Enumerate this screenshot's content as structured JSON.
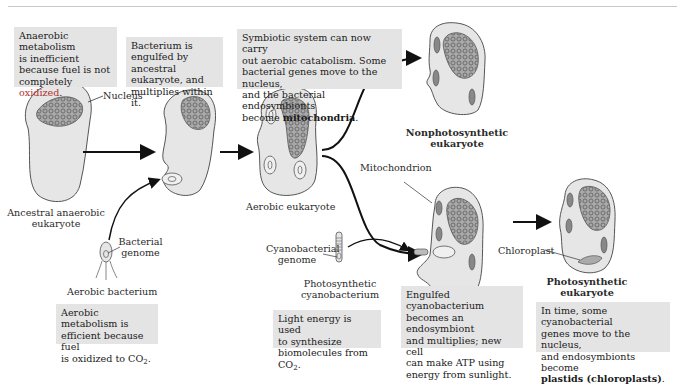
{
  "captions": {
    "anaerobic_inefficient": {
      "lines": [
        "Anaerobic",
        "metabolism",
        "is inefficient",
        "because fuel is not",
        "completely "
      ],
      "highlight": "oxidized",
      "end": "."
    },
    "engulfed_bacterium": [
      "Bacterium is",
      "engulfed by ancestral",
      "eukaryote, and",
      "multiplies within it."
    ],
    "symbiotic_system": {
      "lines": [
        "Symbiotic system can now carry",
        "out aerobic catabolism. Some",
        "bacterial genes move to the nucleus,",
        "and the bacterial endosymbionts",
        "become "
      ],
      "bold": "mitochondria",
      "end": "."
    },
    "aerobic_efficient": {
      "lines": [
        "Aerobic metabolism is",
        "efficient because fuel",
        "is oxidized to CO"
      ],
      "sub": "2",
      "end": "."
    },
    "light_energy": {
      "lines": [
        "Light energy is used",
        "to synthesize",
        "biomolecules from CO"
      ],
      "sub": "2",
      "end": "."
    },
    "engulfed_cyanobacterium": [
      "Engulfed cyanobacterium",
      "becomes an endosymbiont",
      "and multiplies; new cell",
      "can make ATP using",
      "energy from sunlight."
    ],
    "plastids": {
      "lines": [
        "In time, some cyanobacterial",
        "genes move to the nucleus,",
        "and endosymbionts become"
      ],
      "bold": "plastids (chloroplasts)",
      "end": "."
    }
  },
  "labels": {
    "nucleus": "Nucleus",
    "ancestral": [
      "Ancestral anaerobic",
      "eukaryote"
    ],
    "bacterial_genome": [
      "Bacterial",
      "genome"
    ],
    "aerobic_bacterium": "Aerobic bacterium",
    "aerobic_eukaryote": "Aerobic eukaryote",
    "nonphotosynthetic": [
      "Nonphotosynthetic",
      "eukaryote"
    ],
    "mitochondrion": "Mitochondrion",
    "cyanobacterial_genome": [
      "Cyanobacterial",
      "genome"
    ],
    "photosynthetic_cyanobacterium": [
      "Photosynthetic",
      "cyanobacterium"
    ],
    "chloroplast": "Chloroplast",
    "photosynthetic_eukaryote": [
      "Photosynthetic",
      "eukaryote"
    ]
  },
  "colors": {
    "caption_bg": "#e4e4e4",
    "cell_fill": "#e6e6e6",
    "cell_stroke": "#555555",
    "nucleus_fill": "#9a9a9a",
    "arrow": "#111111",
    "highlight_red": "#b23030"
  }
}
